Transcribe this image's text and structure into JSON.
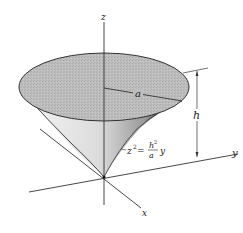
{
  "figure": {
    "axes": {
      "z_label": "z",
      "y_label": "y",
      "x_label": "x"
    },
    "dimensions": {
      "radius_label": "a",
      "height_label": "h"
    },
    "equation": {
      "lhs": "z",
      "lhs_exp": "2",
      "equals": "=",
      "num": "h",
      "num_exp": "2",
      "den": "a",
      "rhs_var": "y"
    },
    "colors": {
      "cap_fill": "#b9b9b9",
      "surface_light": "#e8e8e8",
      "surface_dark": "#3a3a3a",
      "line": "#333333"
    }
  }
}
